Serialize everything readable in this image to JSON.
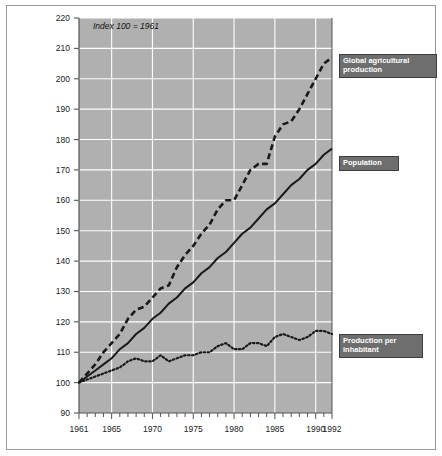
{
  "figure": {
    "background_color": "#ffffff",
    "frame_color": "#9a9a9a",
    "plot_background_color": "#b0b0b0",
    "gridline_color": "#ffffff",
    "axis_color": "#555555"
  },
  "annotations": {
    "index_note": "Index 100 = 1961"
  },
  "callouts": {
    "agricultural": "Global agricultural\nproduction",
    "population": "Population",
    "per_inhabitant": "Production per\ninhabitant"
  },
  "chart_data": {
    "type": "line",
    "title": "",
    "subtitle": "",
    "xlabel": "",
    "ylabel": "",
    "xlim": [
      1961,
      1992
    ],
    "ylim": [
      90,
      220
    ],
    "ytick_values": [
      90,
      100,
      110,
      120,
      130,
      140,
      150,
      160,
      170,
      180,
      190,
      200,
      210,
      220
    ],
    "ytick_labels": [
      "90",
      "100",
      "110",
      "120",
      "130",
      "140",
      "150",
      "160",
      "170",
      "180",
      "190",
      "200",
      "210",
      "220"
    ],
    "xtick_values": [
      1961,
      1965,
      1970,
      1975,
      1980,
      1985,
      1990,
      1992
    ],
    "xtick_labels": [
      "1961",
      "1965",
      "1970",
      "1975",
      "1980",
      "1985",
      "1990",
      "1992"
    ],
    "x_minor_tick_interval": 1,
    "grid": {
      "horizontal": true,
      "vertical": true,
      "vertical_at": [
        1965,
        1970,
        1975,
        1980,
        1985,
        1990
      ],
      "color": "#ffffff"
    },
    "legend": {
      "position": "right-callouts",
      "style": "label-boxes"
    },
    "x": [
      1961,
      1962,
      1963,
      1964,
      1965,
      1966,
      1967,
      1968,
      1969,
      1970,
      1971,
      1972,
      1973,
      1974,
      1975,
      1976,
      1977,
      1978,
      1979,
      1980,
      1981,
      1982,
      1983,
      1984,
      1985,
      1986,
      1987,
      1988,
      1989,
      1990,
      1991,
      1992
    ],
    "series": [
      {
        "name": "Global agricultural production",
        "key": "agricultural",
        "style": "dashed",
        "color": "#1a1a1a",
        "values": [
          100,
          103,
          106,
          110,
          113,
          116,
          121,
          124,
          125,
          128,
          131,
          132,
          138,
          142,
          145,
          149,
          152,
          157,
          160,
          160,
          165,
          170,
          172,
          172,
          181,
          185,
          186,
          190,
          195,
          200,
          205,
          207
        ]
      },
      {
        "name": "Population",
        "key": "population",
        "style": "solid",
        "color": "#1a1a1a",
        "values": [
          100,
          102,
          104,
          106,
          108,
          111,
          113,
          116,
          118,
          121,
          123,
          126,
          128,
          131,
          133,
          136,
          138,
          141,
          143,
          146,
          149,
          151,
          154,
          157,
          159,
          162,
          165,
          167,
          170,
          172,
          175,
          177
        ]
      },
      {
        "name": "Production per inhabitant",
        "key": "per_inhabitant",
        "style": "dotted",
        "color": "#1a1a1a",
        "values": [
          100,
          101,
          102,
          103,
          104,
          105,
          107,
          108,
          107,
          107,
          109,
          107,
          108,
          109,
          109,
          110,
          110,
          112,
          113,
          111,
          111,
          113,
          113,
          112,
          115,
          116,
          115,
          114,
          115,
          117,
          117,
          116
        ]
      }
    ]
  }
}
